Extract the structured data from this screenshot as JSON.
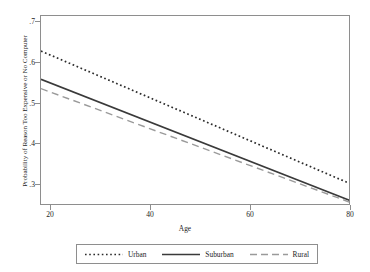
{
  "chart_data": {
    "type": "line",
    "title": "",
    "xlabel": "Age",
    "ylabel": "Probability of Reason Too Expensive or No Computer",
    "xlim": [
      18,
      80
    ],
    "ylim": [
      0.265,
      0.715
    ],
    "xticks": [
      "20",
      "40",
      "60",
      "80"
    ],
    "xtick_values": [
      20,
      40,
      60,
      80
    ],
    "yticks": [
      ".3",
      ".4",
      ".5",
      ".6",
      ".7"
    ],
    "ytick_values": [
      0.3,
      0.4,
      0.5,
      0.6,
      0.7
    ],
    "grid": false,
    "legend_position": "bottom",
    "x": [
      18,
      80
    ],
    "series": [
      {
        "name": "Urban",
        "style": "dotted",
        "color": "#2b2b2b",
        "values": [
          0.632,
          0.317
        ]
      },
      {
        "name": "Suburban",
        "style": "solid",
        "color": "#3a3a3a",
        "values": [
          0.565,
          0.277
        ]
      },
      {
        "name": "Rural",
        "style": "dashed",
        "color": "#9a9a9a",
        "values": [
          0.543,
          0.273
        ]
      }
    ]
  },
  "axis": {
    "y_title": "Probability of Reason Too Expensive or No Computer",
    "x_title": "Age",
    "y_labels": [
      ".7",
      ".6",
      ".5",
      ".4",
      ".3"
    ],
    "x_labels": [
      "20",
      "40",
      "60",
      "80"
    ]
  },
  "legend": {
    "items": [
      {
        "label": "Urban"
      },
      {
        "label": "Suburban"
      },
      {
        "label": "Rural"
      }
    ]
  },
  "colors": {
    "frame": "#8e8e8e",
    "urban": "#2b2b2b",
    "suburban": "#3a3a3a",
    "rural": "#9a9a9a",
    "background": "#ffffff"
  }
}
